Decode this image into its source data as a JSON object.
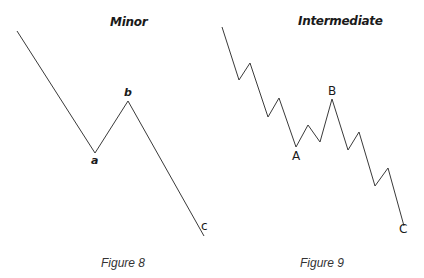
{
  "figure8": {
    "title": "Minor",
    "caption": "Figure 8",
    "labels": {
      "a": "a",
      "b": "b",
      "c": "c"
    },
    "points": "17,31 95,153 128,101 204,236"
  },
  "figure9": {
    "title": "Intermediate",
    "caption": "Figure 9",
    "labels": {
      "A": "A",
      "B": "B",
      "C": "C"
    },
    "points": "222,27 239,80 250,63 268,117 279,98 296,147 308,125 320,142 332,99 348,150 359,132 375,186 388,168 404,226"
  },
  "colors": {
    "line": "#3a3a3a",
    "text": "#1a1a1a"
  }
}
